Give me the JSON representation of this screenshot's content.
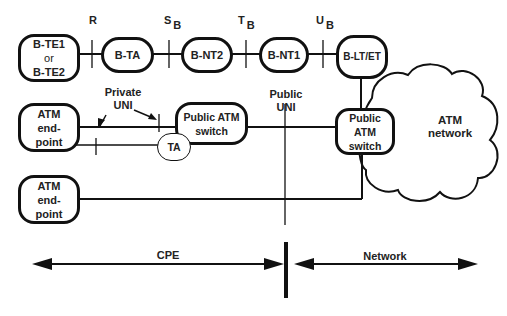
{
  "diagram": {
    "top_row": {
      "nodes": [
        {
          "id": "b-te",
          "lines": [
            "B-TE1",
            "or",
            "B-TE2"
          ]
        },
        {
          "id": "b-ta",
          "label": "B-TA"
        },
        {
          "id": "b-nt2",
          "label": "B-NT2"
        },
        {
          "id": "b-nt1",
          "label": "B-NT1"
        },
        {
          "id": "b-lt-et",
          "label": "B-LT/ET"
        }
      ],
      "reference_points": [
        {
          "main": "R",
          "sub": ""
        },
        {
          "main": "S",
          "sub": "B"
        },
        {
          "main": "T",
          "sub": "B"
        },
        {
          "main": "U",
          "sub": "B"
        }
      ]
    },
    "middle": {
      "endpoint1": {
        "lines": [
          "ATM",
          "end-",
          "point"
        ]
      },
      "endpoint2": {
        "lines": [
          "ATM",
          "end-",
          "point"
        ]
      },
      "private_switch": {
        "lines": [
          "Public ATM",
          "switch"
        ]
      },
      "ta": {
        "label": "TA"
      },
      "public_switch": {
        "lines": [
          "Public ATM",
          "switch"
        ]
      },
      "private_uni": {
        "lines": [
          "Private",
          "UNI"
        ]
      },
      "public_uni": {
        "lines": [
          "Public",
          "UNI"
        ]
      },
      "cloud": {
        "lines": [
          "ATM",
          "network"
        ]
      }
    },
    "bottom": {
      "cpe_label": "CPE",
      "network_label": "Network"
    },
    "colors": {
      "stroke": "#111111",
      "text": "#222222",
      "background": "#ffffff"
    }
  }
}
